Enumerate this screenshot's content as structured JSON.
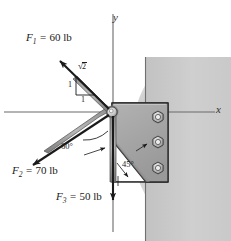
{
  "figure": {
    "axes": {
      "x_label": "x",
      "y_label": "y"
    },
    "forces": [
      {
        "id": "F1",
        "name": "F",
        "subscript": "1",
        "equals": " = ",
        "magnitude": "60",
        "unit": "lb",
        "label": "F1 = 60 lb",
        "direction": "up-left along 1:1 slope"
      },
      {
        "id": "F2",
        "name": "F",
        "subscript": "2",
        "equals": " = ",
        "magnitude": "70",
        "unit": "lb",
        "label": "F2 = 70 lb",
        "direction": "down-left at 60 degrees from negative y-axis"
      },
      {
        "id": "F3",
        "name": "F",
        "subscript": "3",
        "equals": " = ",
        "magnitude": "50",
        "unit": "lb",
        "label": "F3 = 50 lb",
        "direction": "straight down along negative y-axis"
      }
    ],
    "slope_triangle": {
      "vertical": "1",
      "horizontal": "1",
      "hypotenuse_symbol": "2",
      "hypotenuse_label": "sqrt 2"
    },
    "angles": [
      {
        "id": "angle-60",
        "value": "60",
        "symbol": "°",
        "label": "60°"
      },
      {
        "id": "angle-45",
        "value": "45",
        "symbol": "°",
        "label": "45°"
      }
    ],
    "bolts": {
      "count": 3,
      "shape": "hexagonal"
    },
    "colors": {
      "plate_fill": "#a8a8a8",
      "plate_edge": "#303030",
      "wall_fill": "#c6c6c6",
      "vector_stroke": "#1a1a1a",
      "axis_stroke": "#5a5a5a",
      "bolt_fill": "#b4b4b4",
      "background": "#ffffff"
    }
  }
}
